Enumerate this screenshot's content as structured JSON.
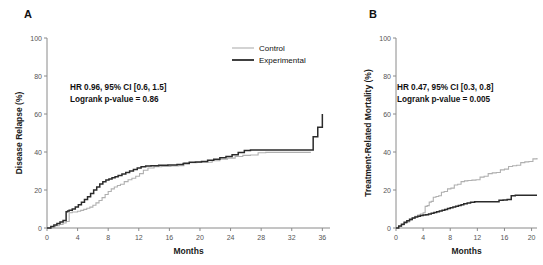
{
  "figure": {
    "panel_a_label": "A",
    "panel_b_label": "B",
    "legend": {
      "control_label": "Control",
      "experimental_label": "Experimental",
      "control_color": "#b0b0b0",
      "experimental_color": "#2b2b2b"
    }
  },
  "chart_data": [
    {
      "id": "panel-a",
      "type": "line",
      "title": "A",
      "subtitle": "",
      "xlabel": "Months",
      "ylabel": "Disease Relapse (%)",
      "xlim": [
        0,
        37
      ],
      "ylim": [
        0,
        100
      ],
      "xticks": [
        0,
        4,
        8,
        12,
        16,
        20,
        24,
        28,
        32,
        36
      ],
      "xticklabels": [
        "0",
        "4",
        "8",
        "12",
        "16",
        "20",
        "24",
        "28",
        "32",
        "36"
      ],
      "yticks": [
        0,
        20,
        40,
        60,
        80,
        100
      ],
      "yticklabels": [
        "0",
        "20",
        "40",
        "60",
        "80",
        "100"
      ],
      "grid": false,
      "legend_position": "top-right",
      "annotations": [
        "HR 0.96, 95% CI [0.6, 1.5]",
        "Logrank p-value = 0.86"
      ],
      "series": [
        {
          "name": "Control",
          "color": "#b0b0b0",
          "step": "post",
          "x": [
            0,
            0.6,
            1.1,
            1.6,
            2.1,
            2.5,
            2.9,
            3.3,
            3.3,
            4.0,
            4.4,
            4.8,
            5.2,
            5.6,
            6.0,
            6.4,
            6.8,
            7.2,
            7.6,
            8.0,
            8.4,
            8.8,
            9.2,
            9.6,
            10.1,
            10.6,
            11.1,
            11.6,
            12.1,
            12.6,
            13.2,
            14.0,
            15.0,
            16.2,
            17.2,
            17.9,
            18.6,
            19.6,
            20.6,
            21.6,
            22.6,
            23.6,
            24.6,
            25.6,
            26.6,
            27.6,
            28.6,
            29.6,
            30.6,
            31.6,
            32.6,
            33.6,
            34.5
          ],
          "y": [
            0,
            0.6,
            1.2,
            1.9,
            2.6,
            3.4,
            8.0,
            8.0,
            8.4,
            8.8,
            9.3,
            9.8,
            10.4,
            11.0,
            12.0,
            13.2,
            14.5,
            16.0,
            17.6,
            19.2,
            20.6,
            21.6,
            22.4,
            23.0,
            24.4,
            25.4,
            26.2,
            27.2,
            28.6,
            30.4,
            31.6,
            32.2,
            32.4,
            32.6,
            32.8,
            34.4,
            34.4,
            34.6,
            34.6,
            35.4,
            36.2,
            36.8,
            37.6,
            38.2,
            38.4,
            39.6,
            39.8,
            39.8,
            39.8,
            39.8,
            39.8,
            39.8,
            39.8
          ]
        },
        {
          "name": "Experimental",
          "color": "#2b2b2b",
          "step": "post",
          "x": [
            0,
            0.5,
            0.9,
            1.3,
            1.7,
            2.1,
            2.5,
            2.7,
            2.9,
            3.3,
            3.7,
            4.1,
            4.5,
            4.9,
            5.3,
            5.7,
            6.1,
            6.5,
            6.9,
            7.3,
            7.7,
            8.1,
            8.5,
            8.9,
            9.3,
            9.8,
            10.3,
            10.8,
            11.3,
            11.8,
            12.3,
            12.9,
            13.6,
            14.6,
            15.8,
            17.0,
            17.8,
            18.6,
            19.4,
            20.2,
            21.0,
            21.8,
            22.6,
            23.4,
            24.2,
            25.0,
            25.8,
            26.6,
            27.4,
            28.2,
            29.0,
            30.0,
            31.0,
            32.0,
            33.0,
            34.0,
            34.8,
            35.1,
            35.4,
            35.7,
            36.0
          ],
          "y": [
            0,
            0.8,
            1.6,
            2.4,
            3.2,
            4.0,
            8.6,
            9.0,
            9.4,
            10.0,
            11.0,
            12.2,
            13.6,
            15.0,
            16.4,
            18.2,
            20.0,
            21.6,
            23.2,
            24.4,
            25.2,
            25.8,
            26.4,
            27.0,
            27.6,
            28.4,
            29.2,
            30.0,
            30.8,
            31.6,
            32.2,
            32.6,
            32.8,
            33.0,
            33.2,
            33.4,
            34.0,
            34.6,
            34.8,
            35.0,
            35.6,
            36.2,
            37.0,
            37.6,
            38.6,
            39.8,
            40.8,
            41.0,
            41.0,
            41.0,
            41.0,
            41.0,
            41.0,
            41.0,
            41.0,
            41.0,
            48.0,
            48.0,
            53.0,
            53.0,
            60.0
          ]
        }
      ]
    },
    {
      "id": "panel-b",
      "type": "line",
      "title": "B",
      "subtitle": "",
      "xlabel": "Months",
      "ylabel": "Treatment-Related Mortality (%)",
      "xlim": [
        0,
        20.8
      ],
      "ylim": [
        0,
        100
      ],
      "xticks": [
        0,
        4,
        8,
        12,
        16,
        20
      ],
      "xticklabels": [
        "0",
        "4",
        "8",
        "12",
        "16",
        "20"
      ],
      "yticks": [
        0,
        20,
        40,
        60,
        80,
        100
      ],
      "yticklabels": [
        "0",
        "20",
        "40",
        "60",
        "80",
        "100"
      ],
      "grid": false,
      "legend_position": "none",
      "annotations": [
        "HR 0.47, 95% CI [0.3, 0.8]",
        "Logrank p-value = 0.005"
      ],
      "series": [
        {
          "name": "Control",
          "color": "#b0b0b0",
          "step": "post",
          "x": [
            0,
            0.4,
            0.8,
            1.2,
            1.6,
            2.0,
            2.4,
            2.8,
            3.2,
            3.6,
            4.0,
            4.3,
            4.6,
            4.9,
            5.2,
            5.5,
            5.9,
            6.3,
            6.7,
            7.1,
            7.6,
            8.1,
            8.6,
            9.1,
            9.6,
            10.1,
            10.6,
            11.2,
            11.8,
            12.4,
            13.0,
            13.6,
            14.2,
            14.8,
            15.4,
            16.0,
            16.6,
            17.2,
            17.8,
            18.4,
            19.0,
            19.6,
            20.2,
            20.8
          ],
          "y": [
            0,
            0.8,
            1.6,
            2.4,
            3.2,
            4.0,
            5.2,
            6.2,
            6.8,
            7.4,
            8.0,
            11.4,
            11.8,
            13.6,
            14.0,
            16.2,
            16.6,
            17.0,
            18.8,
            19.2,
            20.6,
            21.0,
            22.6,
            23.0,
            24.4,
            24.8,
            25.0,
            25.2,
            25.4,
            26.8,
            27.2,
            28.6,
            29.0,
            29.2,
            30.6,
            31.0,
            32.4,
            32.8,
            33.0,
            34.4,
            34.8,
            35.0,
            36.4,
            36.8
          ]
        },
        {
          "name": "Experimental",
          "color": "#2b2b2b",
          "step": "post",
          "x": [
            0,
            0.4,
            0.8,
            1.2,
            1.6,
            2.0,
            2.4,
            2.8,
            3.2,
            3.6,
            4.0,
            4.4,
            4.8,
            5.2,
            5.6,
            6.0,
            6.4,
            6.8,
            7.2,
            7.6,
            8.0,
            8.4,
            8.8,
            9.2,
            9.6,
            10.0,
            10.5,
            11.0,
            11.6,
            12.2,
            12.8,
            13.4,
            14.0,
            14.6,
            15.2,
            15.8,
            16.4,
            17.0,
            17.6,
            18.2,
            18.8,
            19.4,
            20.0,
            20.8
          ],
          "y": [
            0,
            1.0,
            2.0,
            3.0,
            3.8,
            4.6,
            5.2,
            5.8,
            6.2,
            6.6,
            6.8,
            7.0,
            7.4,
            7.8,
            8.2,
            8.6,
            9.0,
            9.4,
            9.8,
            10.2,
            10.6,
            11.0,
            11.4,
            11.8,
            12.2,
            12.8,
            13.2,
            13.6,
            13.8,
            13.8,
            13.8,
            13.8,
            13.8,
            13.8,
            14.6,
            14.8,
            15.0,
            17.0,
            17.2,
            17.2,
            17.2,
            17.2,
            17.2,
            17.2
          ]
        }
      ]
    }
  ]
}
